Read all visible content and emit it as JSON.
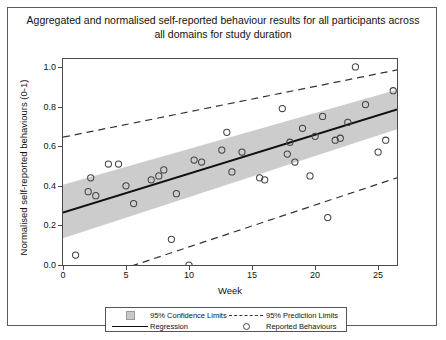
{
  "chart_data": {
    "type": "scatter",
    "title": "Aggregated and normalised self-reported behaviour results for all participants across all domains for study duration",
    "xlabel": "Week",
    "ylabel": "Normalised self-reported behaviours (0-1)",
    "xlim": [
      0,
      26.5
    ],
    "ylim": [
      0,
      1.04
    ],
    "xticks": [
      0,
      5,
      10,
      15,
      20,
      25
    ],
    "xtick_labels": [
      "0",
      "5",
      "10",
      "15",
      "20",
      "25"
    ],
    "yticks": [
      0.0,
      0.2,
      0.4,
      0.6,
      0.8,
      1.0
    ],
    "ytick_labels": [
      "0.0",
      "0.2",
      "0.4",
      "0.6",
      "0.8",
      "1.0"
    ],
    "grid": false,
    "legend_position": "below-axes",
    "series": [
      {
        "name": "Reported Behaviours",
        "type": "scatter",
        "marker": "open-circle",
        "points": [
          [
            1.0,
            0.05
          ],
          [
            2.0,
            0.37
          ],
          [
            2.2,
            0.44
          ],
          [
            2.6,
            0.35
          ],
          [
            3.6,
            0.51
          ],
          [
            4.4,
            0.51
          ],
          [
            5.0,
            0.4
          ],
          [
            5.6,
            0.31
          ],
          [
            7.0,
            0.43
          ],
          [
            7.6,
            0.45
          ],
          [
            8.0,
            0.48
          ],
          [
            8.6,
            0.13
          ],
          [
            9.0,
            0.36
          ],
          [
            10.0,
            0.0
          ],
          [
            10.4,
            0.53
          ],
          [
            11.0,
            0.52
          ],
          [
            12.6,
            0.58
          ],
          [
            13.0,
            0.67
          ],
          [
            13.4,
            0.47
          ],
          [
            14.2,
            0.57
          ],
          [
            15.6,
            0.44
          ],
          [
            16.0,
            0.43
          ],
          [
            17.4,
            0.79
          ],
          [
            17.8,
            0.56
          ],
          [
            18.0,
            0.62
          ],
          [
            18.4,
            0.52
          ],
          [
            19.0,
            0.69
          ],
          [
            19.6,
            0.45
          ],
          [
            20.0,
            0.65
          ],
          [
            20.6,
            0.75
          ],
          [
            21.0,
            0.24
          ],
          [
            21.6,
            0.63
          ],
          [
            22.0,
            0.64
          ],
          [
            22.6,
            0.72
          ],
          [
            23.2,
            1.0
          ],
          [
            24.0,
            0.81
          ],
          [
            25.0,
            0.57
          ],
          [
            25.6,
            0.63
          ],
          [
            26.2,
            0.88
          ]
        ]
      },
      {
        "name": "Regression",
        "type": "line",
        "endpoints": [
          [
            0.0,
            0.265
          ],
          [
            26.5,
            0.785
          ]
        ]
      },
      {
        "name": "95% Confidence Limits",
        "type": "band",
        "upper": [
          [
            0.0,
            0.405
          ],
          [
            26.5,
            0.885
          ]
        ],
        "lower": [
          [
            0.0,
            0.135
          ],
          [
            26.5,
            0.685
          ]
        ]
      },
      {
        "name": "95% Prediction Limits",
        "type": "dashed-band",
        "upper": [
          [
            0.0,
            0.645
          ],
          [
            26.5,
            0.985
          ]
        ],
        "lower": [
          [
            0.0,
            -0.12
          ],
          [
            26.5,
            0.44
          ]
        ]
      }
    ]
  },
  "legend": {
    "entries": [
      {
        "label": "95% Confidence Limits",
        "key": "filled-square-swatch"
      },
      {
        "label": "95% Prediction Limits",
        "key": "dashed-line-swatch"
      },
      {
        "label": "Regression",
        "key": "solid-line-swatch"
      },
      {
        "label": "Reported Behaviours",
        "key": "open-circle-swatch"
      }
    ]
  },
  "colors": {
    "band_fill": "#c9c9c9",
    "regression_line": "#111111",
    "prediction_line": "#333333",
    "marker_stroke": "#444444",
    "axis": "#4a4a4a",
    "frame": "#5a5a5a"
  }
}
